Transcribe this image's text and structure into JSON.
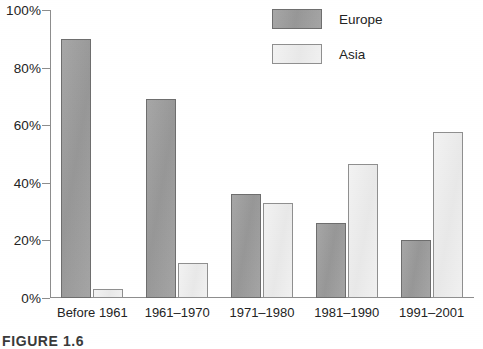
{
  "figure": {
    "caption": "FIGURE 1.6"
  },
  "legend": {
    "position": "top-right",
    "entries": [
      {
        "label": "Europe",
        "color": "#9d9d9d",
        "swatch": "europe-swatch"
      },
      {
        "label": "Asia",
        "color": "#ececec",
        "swatch": "asia-swatch"
      }
    ]
  },
  "axis": {
    "y_ticks": [
      "0%",
      "20%",
      "40%",
      "60%",
      "80%",
      "100%"
    ]
  },
  "chart_data": {
    "type": "bar",
    "title": "",
    "xlabel": "",
    "ylabel": "",
    "ylim": [
      0,
      100
    ],
    "grid": false,
    "legend_position": "top-right",
    "categories": [
      "Before 1961",
      "1961–1970",
      "1971–1980",
      "1981–1990",
      "1991–2001"
    ],
    "series": [
      {
        "name": "Europe",
        "color": "#9d9d9d",
        "values": [
          90,
          69,
          36,
          26,
          20
        ]
      },
      {
        "name": "Asia",
        "color": "#ececec",
        "values": [
          3,
          12,
          33,
          46.5,
          57.5
        ]
      }
    ],
    "tick_labels": [
      "0%",
      "20%",
      "40%",
      "60%",
      "80%",
      "100%"
    ],
    "tick_values": [
      0,
      20,
      40,
      60,
      80,
      100
    ]
  }
}
